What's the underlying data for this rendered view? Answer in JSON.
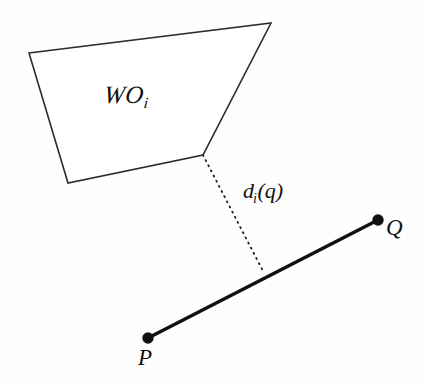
{
  "figure": {
    "width": 427,
    "height": 385,
    "background_color": "#fefefe",
    "stroke_color": "#1a1a1a"
  },
  "labels": {
    "region_main": "ᴡο",
    "region_name": "WO",
    "region_subscript": "i",
    "distance_name": "d",
    "distance_subscript": "i",
    "distance_argument": "(q)",
    "point_p": "P",
    "point_q": "Q"
  },
  "geometry": {
    "obstacle_polygon": {
      "name": "workspace-obstacle",
      "fill": "#ffffff",
      "stroke": "#2a2a2a",
      "stroke_width": 1.6,
      "points": [
        {
          "x": 29,
          "y": 53
        },
        {
          "x": 271,
          "y": 23
        },
        {
          "x": 203,
          "y": 155
        },
        {
          "x": 68,
          "y": 183
        }
      ]
    },
    "path_segment": {
      "name": "path-segment-pq",
      "stroke": "#111111",
      "stroke_width": 3.6,
      "from": {
        "x": 148,
        "y": 338
      },
      "to": {
        "x": 378,
        "y": 220
      }
    },
    "distance_line": {
      "name": "distance-dotted-line",
      "stroke": "#222222",
      "stroke_width": 1.8,
      "dash": "1 4.6",
      "from": {
        "x": 203,
        "y": 155
      },
      "to": {
        "x": 264,
        "y": 273
      }
    },
    "endpoint_p": {
      "name": "endpoint-p",
      "cx": 148,
      "cy": 338,
      "r": 5.6,
      "fill": "#111111"
    },
    "endpoint_q": {
      "name": "endpoint-q",
      "cx": 378,
      "cy": 220,
      "r": 5.6,
      "fill": "#111111"
    }
  }
}
